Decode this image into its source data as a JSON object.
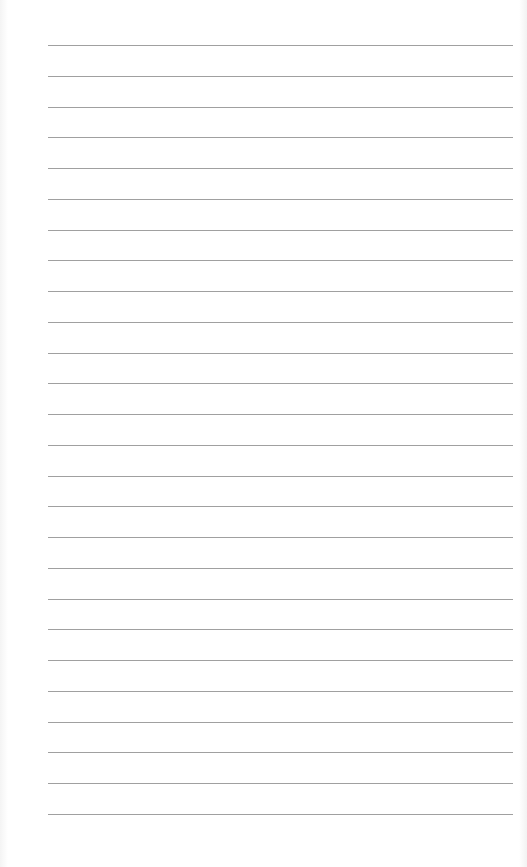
{
  "document": {
    "type": "lined-paper",
    "rule_count": 26,
    "rule_color": "#8f8f8f",
    "background_color": "#ffffff",
    "text": ""
  }
}
